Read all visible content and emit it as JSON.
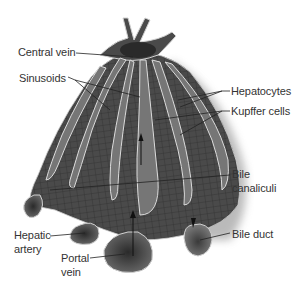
{
  "diagram": {
    "labels": {
      "central_vein": "Central vein",
      "sinusoids": "Sinusoids",
      "hepatocytes": "Hepatocytes",
      "kupffer_cells": "Kupffer cells",
      "bile_canaliculi_line1": "Bile",
      "bile_canaliculi_line2": "canaliculi",
      "hepatic_artery_line1": "Hepatic",
      "hepatic_artery_line2": "artery",
      "portal_vein_line1": "Portal",
      "portal_vein_line2": "vein",
      "bile_duct": "Bile duct"
    },
    "colors": {
      "tissue_dark": "#3a3a3a",
      "tissue_mid": "#5a5a5a",
      "sinusoid_fill": "#7a7a7a",
      "outline_light": "#d8d8d8",
      "text": "#333333",
      "leader_line": "#222222",
      "background": "#ffffff"
    }
  }
}
